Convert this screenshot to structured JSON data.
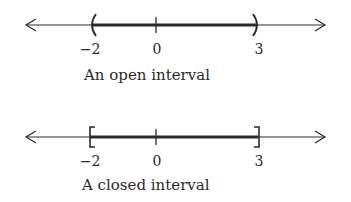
{
  "diagrams": [
    {
      "type": "open",
      "caption": "An open interval",
      "interval": {
        "left": -2,
        "right": 3,
        "left_symbol": "(",
        "right_symbol": ")"
      },
      "ticks": [
        {
          "value": -2,
          "label": "−2"
        },
        {
          "value": 0,
          "label": "0"
        },
        {
          "value": 3,
          "label": "3"
        }
      ]
    },
    {
      "type": "closed",
      "caption": "A closed interval",
      "interval": {
        "left": -2,
        "right": 3,
        "left_symbol": "[",
        "right_symbol": "]"
      },
      "ticks": [
        {
          "value": -2,
          "label": "−2"
        },
        {
          "value": 0,
          "label": "0"
        },
        {
          "value": 3,
          "label": "3"
        }
      ]
    }
  ],
  "colors": {
    "line": "#2a2a2a",
    "background": "#ffffff"
  }
}
